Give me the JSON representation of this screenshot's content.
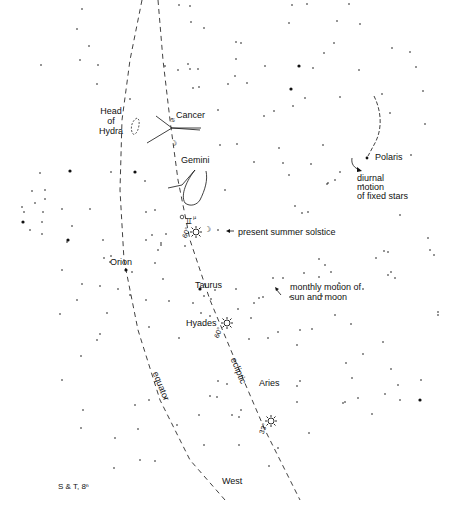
{
  "labels": {
    "head_of_hydra": [
      "Head",
      "of",
      "Hydra"
    ],
    "cancer": "Cancer",
    "gemini": "Gemini",
    "polaris": "Polaris",
    "diurnal": [
      "diurnal",
      "motion",
      "of fixed stars"
    ],
    "summer_solstice": "present summer solstice",
    "orion": "Orion",
    "taurus": "Taurus",
    "monthly": [
      "monthly motion of",
      "sun and moon"
    ],
    "hyades": "Hyades",
    "equator": "equator",
    "ecliptic": "ecliptic",
    "aries": "Aries",
    "west": "West",
    "credit": "S & T, 8ⁿ",
    "deg_solstice": "60°",
    "deg_hyades": "60°",
    "deg_aries": "33°"
  },
  "colors": {
    "ink": "#111111",
    "background": "#ffffff"
  },
  "lines": {
    "equator": [
      [
        142,
        0
      ],
      [
        130,
        60
      ],
      [
        122,
        120
      ],
      [
        120,
        190
      ],
      [
        124,
        260
      ],
      [
        138,
        330
      ],
      [
        160,
        400
      ],
      [
        190,
        460
      ],
      [
        225,
        500
      ]
    ],
    "ecliptic": [
      [
        158,
        0
      ],
      [
        163,
        60
      ],
      [
        170,
        120
      ],
      [
        178,
        180
      ],
      [
        190,
        240
      ],
      [
        210,
        300
      ],
      [
        235,
        360
      ],
      [
        265,
        430
      ],
      [
        300,
        500
      ]
    ]
  },
  "stars": [
    [
      82,
      9,
      1
    ],
    [
      77,
      29,
      1
    ],
    [
      89,
      46,
      1
    ],
    [
      80,
      60,
      1
    ],
    [
      98,
      65,
      1
    ],
    [
      165,
      66,
      1
    ],
    [
      188,
      64,
      1
    ],
    [
      198,
      69,
      1
    ],
    [
      190,
      6,
      1
    ],
    [
      179,
      5,
      1
    ],
    [
      292,
      5,
      1
    ],
    [
      307,
      4,
      1
    ],
    [
      349,
      4,
      1
    ],
    [
      191,
      22,
      1
    ],
    [
      204,
      28,
      1
    ],
    [
      289,
      23,
      1
    ],
    [
      337,
      21,
      1
    ],
    [
      360,
      24,
      1
    ],
    [
      236,
      42,
      1
    ],
    [
      241,
      43,
      1
    ],
    [
      334,
      43,
      1
    ],
    [
      324,
      53,
      1
    ],
    [
      392,
      48,
      1
    ],
    [
      410,
      52,
      1
    ],
    [
      236,
      59,
      1
    ],
    [
      265,
      66,
      1
    ],
    [
      299,
      66,
      2
    ],
    [
      313,
      68,
      1
    ],
    [
      359,
      70,
      1
    ],
    [
      416,
      67,
      1
    ],
    [
      178,
      70,
      1
    ],
    [
      190,
      69,
      1
    ],
    [
      235,
      76,
      1
    ],
    [
      247,
      83,
      1
    ],
    [
      228,
      84,
      1
    ],
    [
      193,
      88,
      1
    ],
    [
      199,
      87,
      1
    ],
    [
      291,
      89,
      2
    ],
    [
      305,
      98,
      1
    ],
    [
      340,
      97,
      1
    ],
    [
      97,
      84,
      1
    ],
    [
      130,
      99,
      1
    ],
    [
      218,
      110,
      1
    ],
    [
      264,
      116,
      1
    ],
    [
      293,
      106,
      1
    ],
    [
      274,
      111,
      1
    ],
    [
      382,
      94,
      1
    ],
    [
      390,
      113,
      1
    ],
    [
      423,
      91,
      1
    ],
    [
      425,
      124,
      1
    ],
    [
      41,
      65,
      1
    ],
    [
      40,
      173,
      1
    ],
    [
      45,
      190,
      1
    ],
    [
      32,
      191,
      1
    ],
    [
      35,
      203,
      1
    ],
    [
      22,
      207,
      1
    ],
    [
      24,
      212,
      1
    ],
    [
      43,
      212,
      1
    ],
    [
      42,
      222,
      1
    ],
    [
      30,
      230,
      1
    ],
    [
      42,
      234,
      1
    ],
    [
      45,
      199,
      1
    ],
    [
      23,
      222,
      2
    ],
    [
      70,
      171,
      2
    ],
    [
      62,
      209,
      1
    ],
    [
      68,
      240,
      2
    ],
    [
      72,
      226,
      1
    ],
    [
      111,
      172,
      1
    ],
    [
      90,
      209,
      1
    ],
    [
      145,
      181,
      1
    ],
    [
      135,
      172,
      2
    ],
    [
      146,
      212,
      1
    ],
    [
      155,
      210,
      1
    ],
    [
      161,
      245,
      1
    ],
    [
      166,
      234,
      1
    ],
    [
      146,
      240,
      1
    ],
    [
      103,
      240,
      1
    ],
    [
      110,
      262,
      1
    ],
    [
      185,
      246,
      1
    ],
    [
      111,
      256,
      1
    ],
    [
      67,
      242,
      1
    ],
    [
      104,
      258,
      1
    ],
    [
      132,
      272,
      1
    ],
    [
      126,
      270,
      2
    ],
    [
      100,
      286,
      1
    ],
    [
      118,
      289,
      1
    ],
    [
      155,
      263,
      1
    ],
    [
      163,
      279,
      1
    ],
    [
      130,
      295,
      1
    ],
    [
      169,
      301,
      1
    ],
    [
      146,
      300,
      1
    ],
    [
      77,
      300,
      1
    ],
    [
      82,
      284,
      1
    ],
    [
      107,
      313,
      1
    ],
    [
      60,
      314,
      1
    ],
    [
      149,
      327,
      1
    ],
    [
      100,
      334,
      1
    ],
    [
      97,
      340,
      1
    ],
    [
      179,
      338,
      1
    ],
    [
      200,
      289,
      2
    ],
    [
      204,
      296,
      1
    ],
    [
      193,
      303,
      1
    ],
    [
      201,
      313,
      1
    ],
    [
      210,
      316,
      1
    ],
    [
      211,
      299,
      1
    ],
    [
      215,
      290,
      1
    ],
    [
      236,
      289,
      1
    ],
    [
      259,
      298,
      1
    ],
    [
      263,
      297,
      1
    ],
    [
      254,
      303,
      1
    ],
    [
      238,
      309,
      1
    ],
    [
      251,
      318,
      1
    ],
    [
      249,
      339,
      1
    ],
    [
      268,
      338,
      1
    ],
    [
      278,
      332,
      1
    ],
    [
      273,
      278,
      1
    ],
    [
      283,
      278,
      1
    ],
    [
      290,
      297,
      1
    ],
    [
      297,
      345,
      1
    ],
    [
      300,
      330,
      1
    ],
    [
      312,
      329,
      1
    ],
    [
      322,
      296,
      1
    ],
    [
      319,
      277,
      1
    ],
    [
      325,
      265,
      1
    ],
    [
      339,
      283,
      1
    ],
    [
      335,
      315,
      1
    ],
    [
      351,
      324,
      1
    ],
    [
      319,
      259,
      1
    ],
    [
      304,
      273,
      1
    ],
    [
      331,
      272,
      1
    ],
    [
      363,
      289,
      1
    ],
    [
      383,
      342,
      1
    ],
    [
      363,
      354,
      1
    ],
    [
      391,
      369,
      1
    ],
    [
      421,
      380,
      1
    ],
    [
      352,
      378,
      1
    ],
    [
      358,
      398,
      1
    ],
    [
      400,
      400,
      1
    ],
    [
      385,
      394,
      1
    ],
    [
      346,
      363,
      1
    ],
    [
      388,
      275,
      1
    ],
    [
      376,
      258,
      1
    ],
    [
      384,
      251,
      1
    ],
    [
      391,
      272,
      1
    ],
    [
      395,
      278,
      1
    ],
    [
      388,
      252,
      1
    ],
    [
      434,
      255,
      1
    ],
    [
      438,
      312,
      1
    ],
    [
      438,
      315,
      1
    ],
    [
      400,
      215,
      1
    ],
    [
      430,
      250,
      1
    ],
    [
      428,
      238,
      1
    ],
    [
      254,
      162,
      1
    ],
    [
      283,
      163,
      1
    ],
    [
      289,
      175,
      1
    ],
    [
      279,
      148,
      1
    ],
    [
      323,
      145,
      1
    ],
    [
      311,
      164,
      1
    ],
    [
      327,
      184,
      1
    ],
    [
      340,
      172,
      1
    ],
    [
      363,
      185,
      1
    ],
    [
      308,
      212,
      1
    ],
    [
      295,
      206,
      1
    ],
    [
      302,
      213,
      1
    ],
    [
      328,
      183,
      1
    ],
    [
      335,
      180,
      1
    ],
    [
      411,
      155,
      1
    ],
    [
      237,
      144,
      1
    ],
    [
      220,
      145,
      1
    ],
    [
      225,
      190,
      1
    ],
    [
      218,
      230,
      1
    ],
    [
      158,
      250,
      1
    ],
    [
      152,
      235,
      1
    ],
    [
      161,
      243,
      1
    ],
    [
      62,
      270,
      1
    ],
    [
      81,
      356,
      1
    ],
    [
      62,
      380,
      1
    ],
    [
      83,
      410,
      1
    ],
    [
      81,
      428,
      1
    ],
    [
      138,
      429,
      1
    ],
    [
      115,
      438,
      1
    ],
    [
      155,
      461,
      1
    ],
    [
      204,
      445,
      1
    ],
    [
      239,
      445,
      1
    ],
    [
      269,
      466,
      1
    ],
    [
      278,
      448,
      1
    ],
    [
      309,
      433,
      1
    ],
    [
      297,
      402,
      1
    ],
    [
      345,
      402,
      1
    ],
    [
      343,
      403,
      1
    ],
    [
      372,
      414,
      1
    ],
    [
      420,
      400,
      2
    ],
    [
      398,
      385,
      1
    ],
    [
      210,
      396,
      1
    ],
    [
      232,
      415,
      1
    ],
    [
      199,
      415,
      1
    ],
    [
      239,
      417,
      1
    ],
    [
      217,
      397,
      1
    ],
    [
      177,
      425,
      1
    ],
    [
      140,
      460,
      1
    ],
    [
      114,
      468,
      1
    ],
    [
      149,
      400,
      1
    ],
    [
      135,
      405,
      1
    ],
    [
      165,
      398,
      1
    ],
    [
      218,
      381,
      1
    ],
    [
      227,
      384,
      1
    ],
    [
      241,
      410,
      1
    ],
    [
      297,
      386,
      1
    ],
    [
      300,
      381,
      1
    ]
  ],
  "constellation_lines": [
    [
      [
        156,
        116
      ],
      [
        172,
        128
      ]
    ],
    [
      [
        172,
        128
      ],
      [
        200,
        130
      ]
    ],
    [
      [
        172,
        128
      ],
      [
        147,
        143
      ]
    ],
    [
      [
        172,
        128
      ],
      [
        201,
        128
      ]
    ],
    [
      [
        168,
        188
      ],
      [
        182,
        185
      ]
    ],
    [
      [
        182,
        185
      ],
      [
        195,
        170
      ]
    ]
  ]
}
